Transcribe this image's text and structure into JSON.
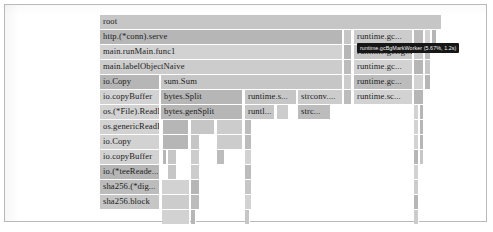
{
  "chart_data": {
    "type": "flamegraph",
    "title": "",
    "xlabel": "",
    "ylabel": "",
    "grid": false,
    "legend": "none",
    "axis_note": "horizontal axis = proportion of samples; vertical axis = stack depth (root at top)",
    "root_label": "root",
    "depth_rows": 14,
    "row_height_px": 15,
    "frames": [
      {
        "depth": 0,
        "label": "root",
        "x": 95,
        "w": 342
      },
      {
        "depth": 1,
        "label": "http.(*conn).serve",
        "x": 95,
        "w": 243
      },
      {
        "depth": 1,
        "label": "",
        "x": 339,
        "w": 8
      },
      {
        "depth": 1,
        "label": "runtime.gc...",
        "x": 349,
        "w": 59
      },
      {
        "depth": 1,
        "label": "",
        "x": 409,
        "w": 10
      },
      {
        "depth": 1,
        "label": "",
        "x": 420,
        "w": 6
      },
      {
        "depth": 1,
        "label": "",
        "x": 427,
        "w": 5
      },
      {
        "depth": 2,
        "label": "main.runMain.func1",
        "x": 95,
        "w": 243
      },
      {
        "depth": 2,
        "label": "",
        "x": 339,
        "w": 8
      },
      {
        "depth": 2,
        "label": "runtime.gcBgMarkWorker",
        "x": 349,
        "w": 59
      },
      {
        "depth": 2,
        "label": "",
        "x": 409,
        "w": 10
      },
      {
        "depth": 2,
        "label": "",
        "x": 420,
        "w": 6
      },
      {
        "depth": 3,
        "label": "main.labelObjectNaive",
        "x": 95,
        "w": 243
      },
      {
        "depth": 3,
        "label": "",
        "x": 339,
        "w": 8
      },
      {
        "depth": 3,
        "label": "runtime.gc...",
        "x": 349,
        "w": 59
      },
      {
        "depth": 3,
        "label": "",
        "x": 409,
        "w": 10
      },
      {
        "depth": 3,
        "label": "",
        "x": 420,
        "w": 6
      },
      {
        "depth": 4,
        "label": "io.Copy",
        "x": 95,
        "w": 60
      },
      {
        "depth": 4,
        "label": "sum.Sum",
        "x": 156,
        "w": 182
      },
      {
        "depth": 4,
        "label": "",
        "x": 339,
        "w": 8
      },
      {
        "depth": 4,
        "label": "runtime.gc...",
        "x": 349,
        "w": 59
      },
      {
        "depth": 4,
        "label": "",
        "x": 409,
        "w": 10
      },
      {
        "depth": 4,
        "label": "",
        "x": 420,
        "w": 6
      },
      {
        "depth": 5,
        "label": "io.copyBuffer",
        "x": 95,
        "w": 60
      },
      {
        "depth": 5,
        "label": "bytes.Split",
        "x": 156,
        "w": 82
      },
      {
        "depth": 5,
        "label": "runtime.s...",
        "x": 240,
        "w": 52
      },
      {
        "depth": 5,
        "label": "strconv....",
        "x": 293,
        "w": 45
      },
      {
        "depth": 5,
        "label": "",
        "x": 339,
        "w": 8
      },
      {
        "depth": 5,
        "label": "runtime.sc...",
        "x": 349,
        "w": 59
      },
      {
        "depth": 5,
        "label": "",
        "x": 409,
        "w": 10
      },
      {
        "depth": 6,
        "label": "os.(*File).ReadFrom",
        "x": 95,
        "w": 60
      },
      {
        "depth": 6,
        "label": "bytes.genSplit",
        "x": 156,
        "w": 82
      },
      {
        "depth": 6,
        "label": "runtl...",
        "x": 240,
        "w": 30
      },
      {
        "depth": 6,
        "label": "",
        "x": 272,
        "w": 12
      },
      {
        "depth": 6,
        "label": "strc...",
        "x": 293,
        "w": 33
      },
      {
        "depth": 6,
        "label": "",
        "x": 409,
        "w": 5
      },
      {
        "depth": 6,
        "label": "",
        "x": 415,
        "w": 4
      },
      {
        "depth": 7,
        "label": "os.genericReadFrom",
        "x": 95,
        "w": 60
      },
      {
        "depth": 7,
        "label": "",
        "x": 158,
        "w": 26
      },
      {
        "depth": 7,
        "label": "",
        "x": 186,
        "w": 24
      },
      {
        "depth": 7,
        "label": "",
        "x": 212,
        "w": 26
      },
      {
        "depth": 7,
        "label": "",
        "x": 240,
        "w": 7
      },
      {
        "depth": 7,
        "label": "",
        "x": 409,
        "w": 5
      },
      {
        "depth": 7,
        "label": "",
        "x": 415,
        "w": 4
      },
      {
        "depth": 8,
        "label": "io.Copy",
        "x": 95,
        "w": 60
      },
      {
        "depth": 8,
        "label": "",
        "x": 158,
        "w": 26
      },
      {
        "depth": 8,
        "label": "",
        "x": 186,
        "w": 9
      },
      {
        "depth": 8,
        "label": "",
        "x": 212,
        "w": 26
      },
      {
        "depth": 8,
        "label": "",
        "x": 240,
        "w": 7
      },
      {
        "depth": 8,
        "label": "",
        "x": 409,
        "w": 5
      },
      {
        "depth": 8,
        "label": "",
        "x": 415,
        "w": 4
      },
      {
        "depth": 9,
        "label": "io.copyBuffer",
        "x": 95,
        "w": 60
      },
      {
        "depth": 9,
        "label": "",
        "x": 158,
        "w": 3
      },
      {
        "depth": 9,
        "label": "",
        "x": 163,
        "w": 9
      },
      {
        "depth": 9,
        "label": "",
        "x": 186,
        "w": 9
      },
      {
        "depth": 9,
        "label": "",
        "x": 212,
        "w": 8
      },
      {
        "depth": 9,
        "label": "",
        "x": 240,
        "w": 7
      },
      {
        "depth": 9,
        "label": "",
        "x": 409,
        "w": 5
      },
      {
        "depth": 9,
        "label": "",
        "x": 415,
        "w": 4
      },
      {
        "depth": 10,
        "label": "io.(*teeReade...",
        "x": 95,
        "w": 60
      },
      {
        "depth": 10,
        "label": "",
        "x": 163,
        "w": 9
      },
      {
        "depth": 10,
        "label": "",
        "x": 186,
        "w": 9
      },
      {
        "depth": 10,
        "label": "",
        "x": 240,
        "w": 7
      },
      {
        "depth": 10,
        "label": "",
        "x": 409,
        "w": 5
      },
      {
        "depth": 11,
        "label": "sha256.(*dig...",
        "x": 95,
        "w": 60
      },
      {
        "depth": 11,
        "label": "",
        "x": 157,
        "w": 28
      },
      {
        "depth": 11,
        "label": "",
        "x": 186,
        "w": 9
      },
      {
        "depth": 11,
        "label": "",
        "x": 240,
        "w": 7
      },
      {
        "depth": 11,
        "label": "",
        "x": 409,
        "w": 5
      },
      {
        "depth": 12,
        "label": "sha256.block",
        "x": 95,
        "w": 60
      },
      {
        "depth": 12,
        "label": "",
        "x": 157,
        "w": 28
      },
      {
        "depth": 12,
        "label": "",
        "x": 186,
        "w": 9
      },
      {
        "depth": 12,
        "label": "",
        "x": 240,
        "w": 7
      },
      {
        "depth": 12,
        "label": "",
        "x": 409,
        "w": 5
      },
      {
        "depth": 13,
        "label": "",
        "x": 157,
        "w": 28
      },
      {
        "depth": 13,
        "label": "",
        "x": 186,
        "w": 5
      },
      {
        "depth": 13,
        "label": "",
        "x": 240,
        "w": 5
      },
      {
        "depth": 13,
        "label": "",
        "x": 409,
        "w": 5
      }
    ]
  },
  "tooltip": {
    "text": "runtime.gcBgMarkWorker (5.67%, 1.2s)",
    "x": 352,
    "y": 38,
    "visible": true
  }
}
